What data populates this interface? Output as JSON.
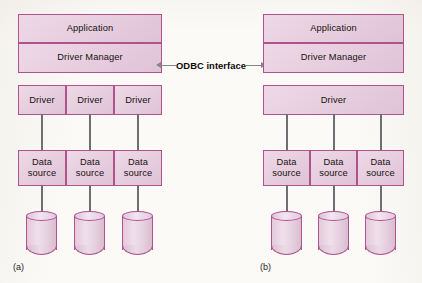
{
  "figure": {
    "center_annotation": {
      "label": "ODBC interface",
      "left_arrow_icon": "arrow-left-icon",
      "right_arrow_icon": "arrow-right-icon"
    },
    "panels": [
      {
        "id": "a",
        "caption": "(a)",
        "application": "Application",
        "driver_manager": "Driver Manager",
        "drivers": [
          "Driver",
          "Driver",
          "Driver"
        ],
        "data_sources": [
          "Data source",
          "Data source",
          "Data source"
        ],
        "databases": [
          "database-cylinder",
          "database-cylinder",
          "database-cylinder"
        ]
      },
      {
        "id": "b",
        "caption": "(b)",
        "application": "Application",
        "driver_manager": "Driver Manager",
        "drivers": [
          "Driver"
        ],
        "data_sources": [
          "Data source",
          "Data source",
          "Data source"
        ],
        "databases": [
          "database-cylinder",
          "database-cylinder",
          "database-cylinder"
        ]
      }
    ]
  },
  "colors": {
    "box_fill": "#e7cfe0",
    "box_border": "#b0528c",
    "connector": "#6f6f72",
    "background": "#fbfaf7",
    "text": "#18120f"
  }
}
